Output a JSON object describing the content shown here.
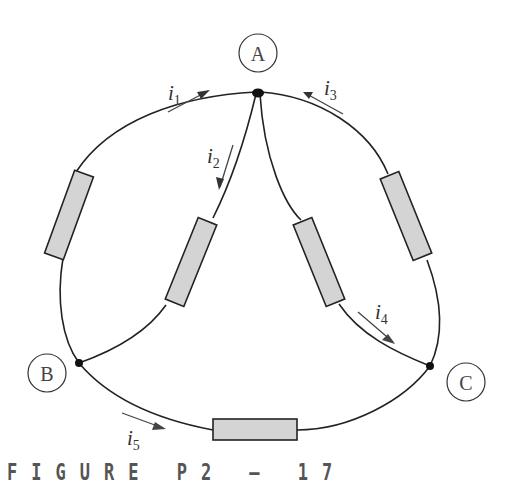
{
  "figure": {
    "caption": "FIGURE P2-17",
    "caption_display": "FIGURE P2 – 17"
  },
  "nodes": [
    {
      "id": "A",
      "label": "A"
    },
    {
      "id": "B",
      "label": "B"
    },
    {
      "id": "C",
      "label": "C"
    }
  ],
  "currents": [
    {
      "id": "i1",
      "symbol": "i",
      "sub": "1",
      "direction": "toward A along outer arc from B"
    },
    {
      "id": "i2",
      "symbol": "i",
      "sub": "2",
      "direction": "from A toward B along inner branch"
    },
    {
      "id": "i3",
      "symbol": "i",
      "sub": "3",
      "direction": "toward A along outer arc from C"
    },
    {
      "id": "i4",
      "symbol": "i",
      "sub": "4",
      "direction": "from A toward C along inner branch"
    },
    {
      "id": "i5",
      "symbol": "i",
      "sub": "5",
      "direction": "from B toward C along bottom"
    }
  ],
  "resistors": [
    {
      "id": "R-AB-outer"
    },
    {
      "id": "R-AB-inner"
    },
    {
      "id": "R-AC-inner"
    },
    {
      "id": "R-AC-outer"
    },
    {
      "id": "R-BC"
    }
  ]
}
